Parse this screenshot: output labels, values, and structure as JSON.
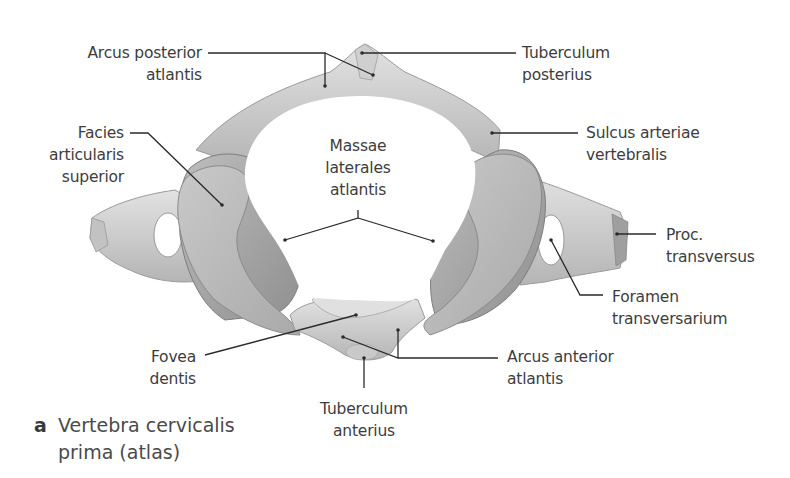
{
  "figure": {
    "caption": {
      "letter": "a",
      "line1": "Vertebra cervicalis",
      "line2": "prima (atlas)"
    },
    "labels": {
      "arcus_posterior": {
        "line1": "Arcus posterior",
        "line2": "atlantis"
      },
      "tuberculum_posterius": {
        "line1": "Tuberculum",
        "line2": "posterius"
      },
      "facies_articularis": {
        "line1": "Facies",
        "line2": "articularis",
        "line3": "superior"
      },
      "massae_laterales": {
        "line1": "Massae",
        "line2": "laterales",
        "line3": "atlantis"
      },
      "sulcus_arteriae": {
        "line1": "Sulcus arteriae",
        "line2": "vertebralis"
      },
      "proc_transversus": {
        "line1": "Proc.",
        "line2": "transversus"
      },
      "foramen_transversarium": {
        "line1": "Foramen",
        "line2": "transversarium"
      },
      "fovea_dentis": {
        "line1": "Fovea",
        "line2": "dentis"
      },
      "arcus_anterior": {
        "line1": "Arcus anterior",
        "line2": "atlantis"
      },
      "tuberculum_anterius": {
        "line1": "Tuberculum",
        "line2": "anterius"
      }
    },
    "colors": {
      "bone_light": "#d9d9d9",
      "bone_mid": "#b8b8b8",
      "bone_dark": "#8e8e8e",
      "leader_line": "#2a2a2a",
      "text": "#3d3d3d"
    }
  }
}
